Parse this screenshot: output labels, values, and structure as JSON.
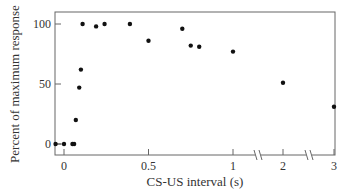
{
  "chart_data": {
    "type": "scatter",
    "title": "",
    "xlabel": "CS-US interval (s)",
    "ylabel": "Percent of maximum response",
    "x_ticks": [
      "0",
      "0.5",
      "1",
      "2",
      "3"
    ],
    "y_ticks": [
      "0",
      "50",
      "100"
    ],
    "ylim": [
      -5,
      105
    ],
    "x_axis_breaks": [
      "between 1 and 2",
      "between 2 and 3"
    ],
    "grid": false,
    "legend": null,
    "points": [
      {
        "x": -0.05,
        "y": 0
      },
      {
        "x": 0.0,
        "y": 0
      },
      {
        "x": 0.05,
        "y": 0
      },
      {
        "x": 0.06,
        "y": 0
      },
      {
        "x": 0.07,
        "y": 20
      },
      {
        "x": 0.09,
        "y": 47
      },
      {
        "x": 0.1,
        "y": 62
      },
      {
        "x": 0.11,
        "y": 100
      },
      {
        "x": 0.19,
        "y": 98
      },
      {
        "x": 0.24,
        "y": 100
      },
      {
        "x": 0.39,
        "y": 100
      },
      {
        "x": 0.5,
        "y": 86
      },
      {
        "x": 0.7,
        "y": 96
      },
      {
        "x": 0.75,
        "y": 82
      },
      {
        "x": 0.8,
        "y": 81
      },
      {
        "x": 1.0,
        "y": 77
      },
      {
        "x": 2.0,
        "y": 51
      },
      {
        "x": 3.0,
        "y": 31
      }
    ]
  }
}
